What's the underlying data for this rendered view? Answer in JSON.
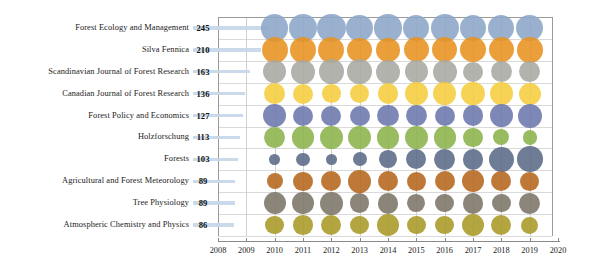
{
  "chart_data": {
    "type": "bubble",
    "title": "",
    "xlabel": "",
    "ylabel": "",
    "xlim": [
      2008,
      2020
    ],
    "x_ticks": [
      2008,
      2009,
      2010,
      2011,
      2012,
      2013,
      2014,
      2015,
      2016,
      2017,
      2018,
      2019,
      2020
    ],
    "bubble_years": [
      2010,
      2011,
      2012,
      2013,
      2014,
      2015,
      2016,
      2017,
      2018,
      2019
    ],
    "grid": true,
    "legend": "none",
    "categories": [
      "Forest Ecology and Management",
      "Silva Fennica",
      "Scandinavian Journal of Forest Research",
      "Canadian Journal of Forest Research",
      "Forest Policy and Economics",
      "Holzforschung",
      "Forests",
      "Agricultural and Forest Meteorology",
      "Tree Physiology",
      "Atmospheric Chemistry and Physics"
    ],
    "totals": [
      245,
      210,
      163,
      136,
      127,
      113,
      103,
      89,
      89,
      86
    ],
    "series": [
      {
        "name": "Forest Ecology and Management",
        "total": 245,
        "color": "#8ba6c8",
        "values": [
          26,
          28,
          28,
          25,
          26,
          24,
          27,
          25,
          24,
          25
        ]
      },
      {
        "name": "Silva Fennica",
        "total": 210,
        "color": "#e8921f",
        "values": [
          24,
          24,
          24,
          21,
          19,
          22,
          22,
          22,
          22,
          23
        ]
      },
      {
        "name": "Scandinavian Journal of Forest Research",
        "total": 163,
        "color": "#a9a9a2",
        "values": [
          19,
          20,
          21,
          21,
          20,
          19,
          20,
          14,
          16,
          15
        ]
      },
      {
        "name": "Canadian Journal of Forest Research",
        "total": 136,
        "color": "#f5cd3e",
        "values": [
          16,
          14,
          12,
          13,
          15,
          18,
          18,
          19,
          18,
          17
        ]
      },
      {
        "name": "Forest Policy and Economics",
        "total": 127,
        "color": "#6b78ad",
        "values": [
          19,
          14,
          14,
          14,
          16,
          15,
          14,
          15,
          18,
          20
        ]
      },
      {
        "name": "Holzforschung",
        "total": 113,
        "color": "#8cb34a",
        "values": [
          15,
          18,
          18,
          18,
          18,
          18,
          17,
          13,
          9,
          7
        ]
      },
      {
        "name": "Forests",
        "total": 103,
        "color": "#5a6a86",
        "values": [
          4,
          6,
          4,
          7,
          11,
          14,
          15,
          15,
          22,
          23
        ]
      },
      {
        "name": "Agricultural and Forest Meteorology",
        "total": 89,
        "color": "#b5651d",
        "values": [
          9,
          13,
          14,
          18,
          14,
          13,
          14,
          17,
          14,
          13
        ]
      },
      {
        "name": "Tree Physiology",
        "total": 89,
        "color": "#7b7566",
        "values": [
          17,
          16,
          18,
          13,
          15,
          11,
          12,
          15,
          12,
          15
        ]
      },
      {
        "name": "Atmospheric Chemistry and Physics",
        "total": 86,
        "color": "#a99a26",
        "values": [
          12,
          13,
          14,
          12,
          16,
          12,
          12,
          17,
          14,
          10
        ]
      }
    ]
  },
  "axis": {
    "tick_2008": "2008",
    "tick_2009": "2009",
    "tick_2010": "2010",
    "tick_2011": "2011",
    "tick_2012": "2012",
    "tick_2013": "2013",
    "tick_2014": "2014",
    "tick_2015": "2015",
    "tick_2016": "2016",
    "tick_2017": "2017",
    "tick_2018": "2018",
    "tick_2019": "2019",
    "tick_2020": "2020"
  }
}
